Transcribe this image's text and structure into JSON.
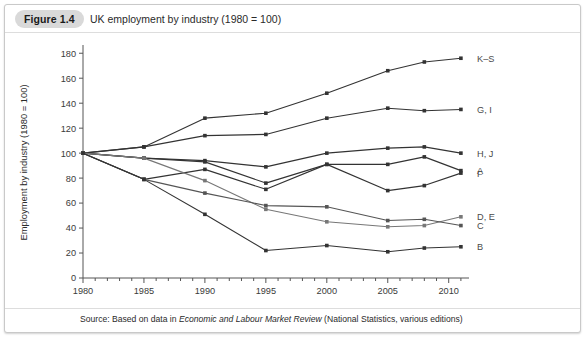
{
  "figure": {
    "tag": "Figure 1.4",
    "title": "UK employment by industry (1980 = 100)"
  },
  "source": {
    "prefix": "Source: Based on data in ",
    "italic": "Economic and Labour Market Review",
    "suffix": " (National Statistics, various editions)"
  },
  "chart_data": {
    "type": "line",
    "title": "UK employment by industry (1980 = 100)",
    "xlabel": "",
    "ylabel": "Employment by industry (1980 = 100)",
    "x": [
      1980,
      1985,
      1990,
      1995,
      2000,
      2005,
      2008,
      2011
    ],
    "xlim": [
      1980,
      2011.5
    ],
    "ylim": [
      0,
      185
    ],
    "xticks": [
      1980,
      1985,
      1990,
      1995,
      2000,
      2005,
      2010
    ],
    "xtick_labels": [
      "1980",
      "1985",
      "1990",
      "1995",
      "2000",
      "2005",
      "2010"
    ],
    "yticks": [
      0,
      20,
      40,
      60,
      80,
      100,
      120,
      140,
      160,
      180
    ],
    "ytick_labels": [
      "0",
      "20",
      "40",
      "60",
      "80",
      "100",
      "120",
      "140",
      "160",
      "180"
    ],
    "grid": false,
    "legend_position": "right-inline",
    "minor_xticks_every": 1,
    "series": [
      {
        "name": "K–S",
        "label": "K–S",
        "color": "#333333",
        "values": [
          100,
          105,
          128,
          132,
          148,
          166,
          173,
          176
        ]
      },
      {
        "name": "G, I",
        "label": "G, I",
        "color": "#333333",
        "values": [
          100,
          105,
          114,
          115,
          128,
          136,
          134,
          135
        ]
      },
      {
        "name": "H, J",
        "label": "H, J",
        "color": "#333333",
        "values": [
          100,
          96,
          94,
          89,
          100,
          104,
          105,
          100
        ]
      },
      {
        "name": "A",
        "label": "A",
        "color": "#333333",
        "values": [
          100,
          96,
          93,
          76,
          91,
          91,
          97,
          86
        ]
      },
      {
        "name": "F",
        "label": "F",
        "color": "#333333",
        "values": [
          100,
          79,
          87,
          71,
          91,
          70,
          74,
          84
        ]
      },
      {
        "name": "D, E",
        "label": "D, E",
        "color": "#777777",
        "values": [
          100,
          96,
          78,
          55,
          45,
          41,
          42,
          49
        ]
      },
      {
        "name": "C",
        "label": "C",
        "color": "#555555",
        "values": [
          100,
          79,
          68,
          58,
          57,
          46,
          47,
          42
        ]
      },
      {
        "name": "B",
        "label": "B",
        "color": "#333333",
        "values": [
          100,
          79,
          51,
          22,
          26,
          21,
          24,
          25
        ]
      }
    ]
  },
  "axis": {
    "y_title": "Employment by industry (1980 = 100)"
  }
}
